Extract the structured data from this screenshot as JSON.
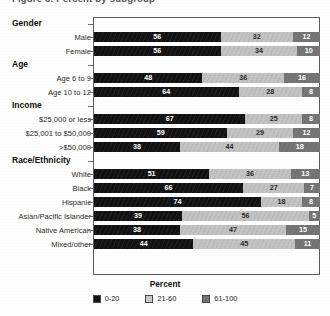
{
  "title_clipped": "Figure 3. Percent by subgroup",
  "chart_data": {
    "type": "bar",
    "orientation": "horizontal",
    "stacked": true,
    "title": "",
    "xlabel": "Percent",
    "ylabel": "",
    "xlim": [
      0,
      100
    ],
    "grid": false,
    "legend_position": "bottom",
    "series": [
      {
        "name": "0-20",
        "color": "#121212"
      },
      {
        "name": "21-60",
        "color": "#c9c9c9"
      },
      {
        "name": "61-100",
        "color": "#737373"
      }
    ],
    "groups": [
      {
        "label": "Gender",
        "rows": [
          {
            "category": "Male",
            "values": [
              56,
              32,
              12
            ]
          },
          {
            "category": "Female",
            "values": [
              56,
              34,
              10
            ]
          }
        ]
      },
      {
        "label": "Age",
        "rows": [
          {
            "category": "Age 6 to 9",
            "values": [
              48,
              36,
              16
            ]
          },
          {
            "category": "Age 10 to 12",
            "values": [
              64,
              28,
              8
            ]
          }
        ]
      },
      {
        "label": "Income",
        "rows": [
          {
            "category": "$25,000 or less",
            "values": [
              67,
              25,
              8
            ]
          },
          {
            "category": "$25,001 to $50,000",
            "values": [
              59,
              29,
              12
            ]
          },
          {
            "category": ">$50,000",
            "values": [
              38,
              44,
              18
            ]
          }
        ]
      },
      {
        "label": "Race/Ethnicity",
        "rows": [
          {
            "category": "White",
            "values": [
              51,
              36,
              13
            ]
          },
          {
            "category": "Black",
            "values": [
              66,
              27,
              7
            ]
          },
          {
            "category": "Hispanic",
            "values": [
              74,
              18,
              8
            ]
          },
          {
            "category": "Asian/Pacific Islander",
            "values": [
              39,
              56,
              5
            ]
          },
          {
            "category": "Native American",
            "values": [
              38,
              47,
              15
            ]
          },
          {
            "category": "Mixed/other",
            "values": [
              44,
              45,
              11
            ]
          }
        ]
      }
    ],
    "legend": [
      "0-20",
      "21-60",
      "61-100"
    ]
  }
}
